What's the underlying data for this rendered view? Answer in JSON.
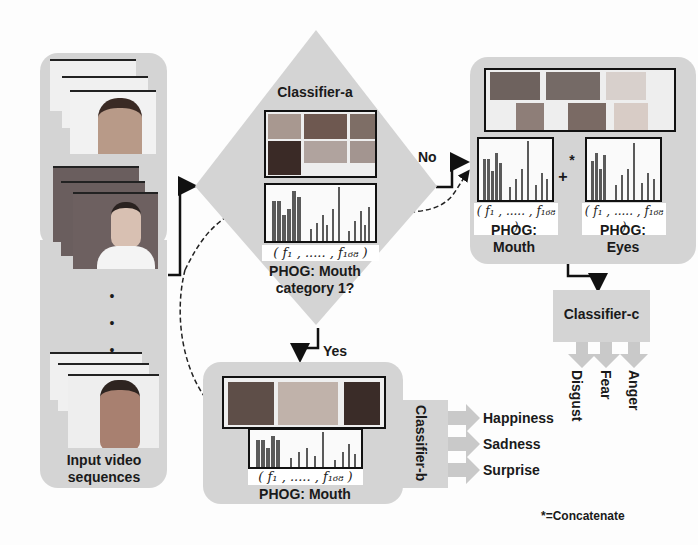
{
  "input_panel": {
    "label_line1": "Input video",
    "label_line2": "sequences",
    "ellipsis": [
      "•",
      "•",
      "•"
    ]
  },
  "classifier_a": {
    "title": "Classifier-a",
    "feature_vector": "( f₁ , ..... , f₁₆₈ )",
    "caption_line1": "PHOG: Mouth",
    "caption_line2": "category 1?",
    "no_label": "No",
    "yes_label": "Yes"
  },
  "no_branch": {
    "mouth_feature_vector": "( f₁ , ..... , f₁₆₈ )",
    "eyes_feature_vector": "( f₁ , ..... , f₁₆₈ )",
    "mouth_caption_line1": "PHOG:",
    "mouth_caption_line2": "Mouth",
    "eyes_caption_line1": "PHOG:",
    "eyes_caption_line2": "Eyes",
    "plus": "+",
    "concat_marker": "*"
  },
  "classifier_c": {
    "title": "Classifier-c",
    "outputs": [
      "Disgust",
      "Fear",
      "Anger"
    ]
  },
  "yes_branch": {
    "feature_vector": "( f₁ , ..... , f₁₆₈ )",
    "caption": "PHOG: Mouth"
  },
  "classifier_b": {
    "title": "Classifier-b",
    "outputs": [
      "Happiness",
      "Sadness",
      "Surprise"
    ]
  },
  "legend": {
    "concatenate_note": "*=Concatenate"
  },
  "colors": {
    "panel": "#d4d4d4",
    "arrow_fill": "#c9c9c9",
    "line": "#111111",
    "bar": "#555555"
  }
}
